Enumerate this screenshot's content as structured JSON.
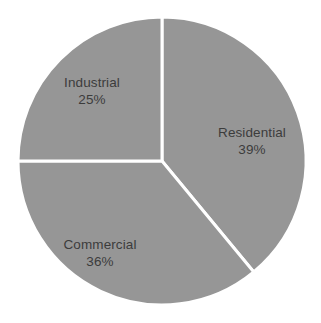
{
  "chart_data": {
    "type": "pie",
    "title": "",
    "subtitle": "",
    "xlabel": "",
    "ylabel": "",
    "legend": "none",
    "grid": false,
    "start_angle_deg": 0,
    "direction": "clockwise",
    "categories": [
      "Residential",
      "Commercial",
      "Industrial"
    ],
    "values": [
      39,
      36,
      25
    ],
    "value_unit": "%",
    "labels": [
      {
        "name": "Residential",
        "value": "39%",
        "percent": 39
      },
      {
        "name": "Commercial",
        "value": "36%",
        "percent": 36
      },
      {
        "name": "Industrial",
        "value": "25%",
        "percent": 25
      }
    ],
    "slice_color": "#969696",
    "divider_color": "#ffffff",
    "label_color": "#3c3c3c",
    "background_color": "#ffffff"
  },
  "figure": {
    "center_x": 162,
    "center_y": 161,
    "radius": 144,
    "divider_width": 3
  }
}
